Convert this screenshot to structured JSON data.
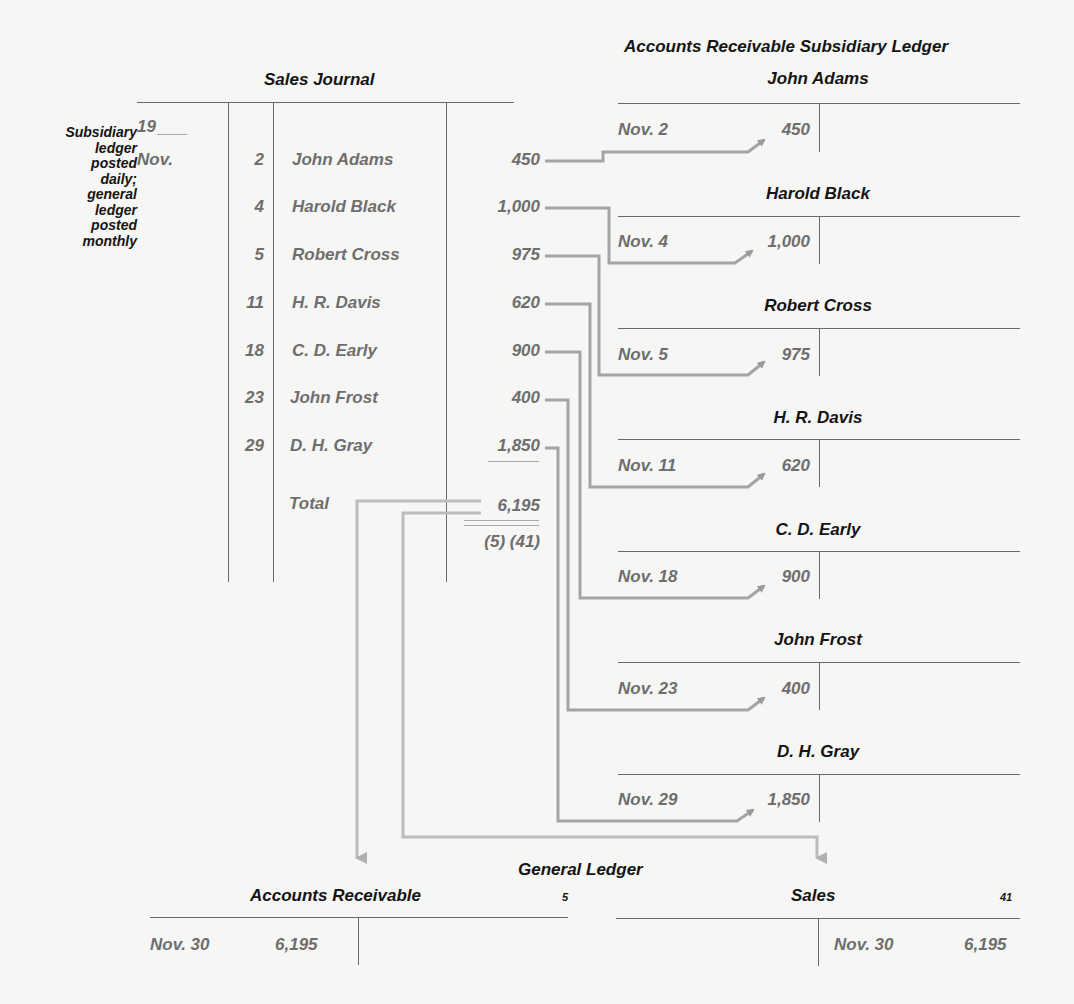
{
  "side_note": [
    "Subsidiary",
    "ledger",
    "posted",
    "daily;",
    "general",
    "ledger",
    "posted",
    "monthly"
  ],
  "sales_journal": {
    "title": "Sales Journal",
    "year": "19",
    "month": "Nov.",
    "rows": [
      {
        "day": "2",
        "name": "John Adams",
        "amount": "450"
      },
      {
        "day": "4",
        "name": "Harold Black",
        "amount": "1,000"
      },
      {
        "day": "5",
        "name": "Robert Cross",
        "amount": "975"
      },
      {
        "day": "11",
        "name": "H. R. Davis",
        "amount": "620"
      },
      {
        "day": "18",
        "name": "C. D. Early",
        "amount": "900"
      },
      {
        "day": "23",
        "name": "John Frost",
        "amount": "400"
      },
      {
        "day": "29",
        "name": "D. H. Gray",
        "amount": "1,850"
      }
    ],
    "total_label": "Total",
    "total_amount": "6,195",
    "posting_refs": "(5) (41)"
  },
  "subsidiary_ledger": {
    "title": "Accounts Receivable Subsidiary Ledger",
    "accounts": [
      {
        "name": "John Adams",
        "date": "Nov. 2",
        "amount": "450"
      },
      {
        "name": "Harold Black",
        "date": "Nov. 4",
        "amount": "1,000"
      },
      {
        "name": "Robert Cross",
        "date": "Nov. 5",
        "amount": "975"
      },
      {
        "name": "H. R. Davis",
        "date": "Nov. 11",
        "amount": "620"
      },
      {
        "name": "C. D. Early",
        "date": "Nov. 18",
        "amount": "900"
      },
      {
        "name": "John Frost",
        "date": "Nov. 23",
        "amount": "400"
      },
      {
        "name": "D. H. Gray",
        "date": "Nov. 29",
        "amount": "1,850"
      }
    ]
  },
  "general_ledger": {
    "title": "General Ledger",
    "accounts_receivable": {
      "name": "Accounts Receivable",
      "number": "5",
      "date": "Nov. 30",
      "amount": "6,195"
    },
    "sales": {
      "name": "Sales",
      "number": "41",
      "date": "Nov. 30",
      "amount": "6,195"
    }
  },
  "colors": {
    "line": "#a8a8a8",
    "text_gray": "#6e6e6e",
    "text_dark": "#141414"
  }
}
